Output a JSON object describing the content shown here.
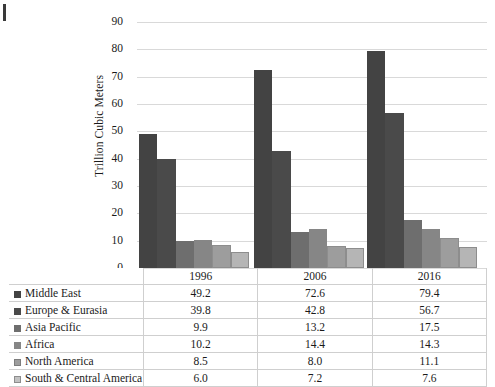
{
  "chart_data": {
    "type": "bar",
    "title": "",
    "xlabel": "",
    "ylabel": "Trillion Cubic Meters",
    "ylim": [
      0,
      90
    ],
    "ytick_step": 10,
    "yticks": [
      90,
      80,
      70,
      60,
      50,
      40,
      30,
      20,
      10,
      0
    ],
    "grid": "horizontal",
    "legend_position": "data-table-below",
    "categories": [
      "1996",
      "2006",
      "2016"
    ],
    "series": [
      {
        "name": "Middle East",
        "values": [
          49.2,
          72.6,
          79.4
        ],
        "color": "#434343",
        "swatch": "s0"
      },
      {
        "name": "Europe & Eurasia",
        "values": [
          39.8,
          42.8,
          56.7
        ],
        "color": "#4a4a4a",
        "swatch": "s1"
      },
      {
        "name": "Asia Pacific",
        "values": [
          9.9,
          13.2,
          17.5
        ],
        "color": "#6e6e6e",
        "swatch": "s2"
      },
      {
        "name": "Africa",
        "values": [
          10.2,
          14.4,
          14.3
        ],
        "color": "#868686",
        "swatch": "s3"
      },
      {
        "name": "North America",
        "values": [
          8.5,
          8.0,
          11.1
        ],
        "color": "#9d9d9d",
        "swatch": "s4"
      },
      {
        "name": "South & Central America",
        "values": [
          6.0,
          7.2,
          7.6
        ],
        "color": "#c2c2c2",
        "swatch": "s5"
      }
    ]
  },
  "table": {
    "corner_label": "",
    "column_headers": [
      "1996",
      "2006",
      "2016"
    ],
    "rows": [
      {
        "label": "Middle East",
        "cells": [
          "49.2",
          "72.6",
          "79.4"
        ]
      },
      {
        "label": "Europe & Eurasia",
        "cells": [
          "39.8",
          "42.8",
          "56.7"
        ]
      },
      {
        "label": "Asia Pacific",
        "cells": [
          "9.9",
          "13.2",
          "17.5"
        ]
      },
      {
        "label": "Africa",
        "cells": [
          "10.2",
          "14.4",
          "14.3"
        ]
      },
      {
        "label": "North America",
        "cells": [
          "8.5",
          "8.0",
          "11.1"
        ]
      },
      {
        "label": "South & Central America",
        "cells": [
          "6.0",
          "7.2",
          "7.6"
        ]
      }
    ]
  },
  "axis": {
    "y_title": "Trillion Cubic Meters"
  }
}
